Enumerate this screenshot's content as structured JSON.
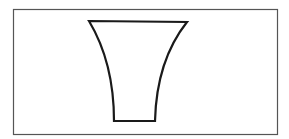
{
  "diagram": {
    "frame": {
      "x": 13,
      "y": 9,
      "width": 264,
      "height": 125,
      "stroke": "#555555",
      "stroke_width": 1.2
    },
    "shape": {
      "name": "flared-vessel",
      "stroke": "#1a1a1a",
      "stroke_width": 2.2,
      "fill": "#ffffff",
      "top_left": [
        89,
        21
      ],
      "top_right": [
        187,
        22
      ],
      "bottom_left": [
        114,
        121
      ],
      "bottom_right": [
        155,
        121
      ]
    }
  }
}
